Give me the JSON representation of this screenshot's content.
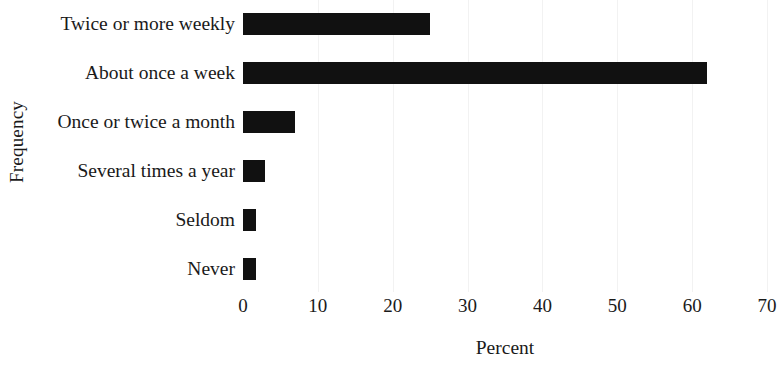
{
  "chart_data": {
    "type": "bar",
    "orientation": "horizontal",
    "title": "",
    "xlabel": "Percent",
    "ylabel": "Frequency",
    "categories": [
      "Twice or more weekly",
      "About once a week",
      "Once or twice a month",
      "Several times a year",
      "Seldom",
      "Never"
    ],
    "values": [
      25,
      62,
      7,
      3,
      1.8,
      1.8
    ],
    "xlim": [
      0,
      70
    ],
    "xticks": [
      0,
      10,
      20,
      30,
      40,
      50,
      60,
      70
    ],
    "xtick_labels": [
      "0",
      "10",
      "20",
      "30",
      "40",
      "50",
      "60",
      "70"
    ],
    "grid": "vertical-faint",
    "legend": "none",
    "bar_color": "#111111",
    "grid_color": "#f2f2f2",
    "background_color": "#ffffff"
  }
}
